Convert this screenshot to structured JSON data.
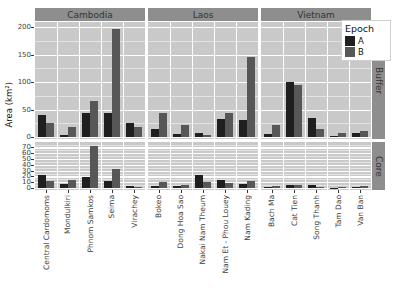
{
  "chart_data": {
    "type": "bar",
    "title": "",
    "ylabel": "Area (km²)",
    "legend": {
      "title": "Epoch",
      "entries": [
        {
          "label": "A",
          "color": "#1f1f1f"
        },
        {
          "label": "B",
          "color": "#575757"
        }
      ]
    },
    "colors": {
      "panel_bg": "#c9c9c9",
      "strip_bg": "#8e8e8e",
      "strip_text": "#333333",
      "grid": "#ffffff",
      "axis_text": "#404040",
      "bar_a": "#1f1f1f",
      "bar_b": "#575757"
    },
    "facet_rows": [
      {
        "label": "Buffer",
        "ticks": [
          0,
          50,
          100,
          150,
          200
        ],
        "minor_step": 25,
        "ymax": 206
      },
      {
        "label": "Core",
        "ticks": [
          0,
          10,
          20,
          30,
          40,
          50,
          60,
          70
        ],
        "minor_step": 5,
        "ymax": 76
      }
    ],
    "facet_columns": [
      {
        "label": "Cambodia",
        "categories": [
          "Central Cardomoms",
          "Mondulkiri",
          "Phnom Samkos",
          "Seima",
          "Virachey"
        ]
      },
      {
        "label": "Laos",
        "categories": [
          "Bokeo",
          "Dong Hoa Sao",
          "Nakai Nam Theum",
          "Nam Et - Phou Louey",
          "Nam Kading"
        ]
      },
      {
        "label": "Vietnam",
        "categories": [
          "Bach Ma",
          "Cat Tien",
          "Song Thanh",
          "Tam Dao",
          "Van Ban"
        ]
      }
    ],
    "series": [
      "A",
      "B"
    ],
    "values": {
      "Buffer": [
        [
          [
            40,
            26
          ],
          [
            4,
            19
          ],
          [
            43,
            65
          ],
          [
            43,
            196
          ],
          [
            26,
            19
          ]
        ],
        [
          [
            15,
            43
          ],
          [
            5,
            22
          ],
          [
            8,
            4
          ],
          [
            33,
            43
          ],
          [
            31,
            145
          ]
        ],
        [
          [
            5,
            22
          ],
          [
            100,
            94
          ],
          [
            35,
            15
          ],
          [
            1,
            7
          ],
          [
            7,
            11
          ]
        ]
      ],
      "Core": [
        [
          [
            22,
            12
          ],
          [
            7,
            13
          ],
          [
            19,
            73
          ],
          [
            12,
            33
          ],
          [
            3,
            2
          ]
        ],
        [
          [
            4,
            10
          ],
          [
            3,
            5
          ],
          [
            23,
            10
          ],
          [
            13,
            8
          ],
          [
            7,
            12
          ]
        ],
        [
          [
            1,
            4
          ],
          [
            6,
            5
          ],
          [
            5,
            1
          ],
          [
            0.3,
            1
          ],
          [
            1,
            3
          ]
        ]
      ]
    }
  }
}
